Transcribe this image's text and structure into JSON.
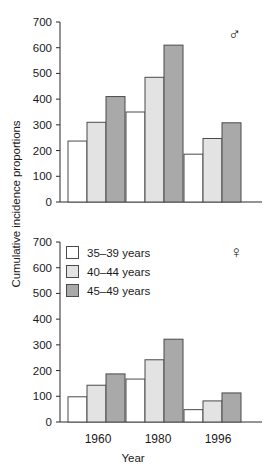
{
  "figure": {
    "y_axis_title": "Cumulative incidence proportions",
    "x_axis_title": "Year"
  },
  "legend": {
    "items": [
      {
        "label": "35–39 years",
        "color": "#ffffff",
        "swatch_name": "legend-swatch-35-39"
      },
      {
        "label": "40–44 years",
        "color": "#e3e3e3",
        "swatch_name": "legend-swatch-40-44"
      },
      {
        "label": "45–49 years",
        "color": "#a9a9a9",
        "swatch_name": "legend-swatch-45-49"
      }
    ]
  },
  "panels": [
    {
      "id": "male",
      "sex_symbol": "♂",
      "sex_name": "male-symbol"
    },
    {
      "id": "female",
      "sex_symbol": "♀",
      "sex_name": "female-symbol"
    }
  ],
  "y_ticks": [
    "0",
    "100",
    "200",
    "300",
    "400",
    "500",
    "600",
    "700"
  ],
  "x_ticks": [
    "1960",
    "1980",
    "1996"
  ],
  "chart_data": [
    {
      "type": "bar",
      "title": "Male",
      "panel": "top",
      "sex_symbol": "♂",
      "xlabel": "Year",
      "ylabel": "Cumulative incidence proportions",
      "categories": [
        "1960",
        "1980",
        "1996"
      ],
      "ylim": [
        0,
        700
      ],
      "ytick_step": 100,
      "grid": false,
      "legend_position": "none",
      "series": [
        {
          "name": "35–39 years",
          "color": "#ffffff",
          "values": [
            237,
            350,
            186
          ]
        },
        {
          "name": "40–44 years",
          "color": "#e3e3e3",
          "values": [
            310,
            485,
            247
          ]
        },
        {
          "name": "45–49 years",
          "color": "#a9a9a9",
          "values": [
            410,
            610,
            308
          ]
        }
      ]
    },
    {
      "type": "bar",
      "title": "Female",
      "panel": "bottom",
      "sex_symbol": "♀",
      "xlabel": "Year",
      "ylabel": "Cumulative incidence proportions",
      "categories": [
        "1960",
        "1980",
        "1996"
      ],
      "ylim": [
        0,
        700
      ],
      "ytick_step": 100,
      "grid": false,
      "legend_position": "upper-left",
      "series": [
        {
          "name": "35–39 years",
          "color": "#ffffff",
          "values": [
            98,
            167,
            48
          ]
        },
        {
          "name": "40–44 years",
          "color": "#e3e3e3",
          "values": [
            143,
            242,
            82
          ]
        },
        {
          "name": "45–49 years",
          "color": "#a9a9a9",
          "values": [
            187,
            322,
            113
          ]
        }
      ]
    }
  ]
}
